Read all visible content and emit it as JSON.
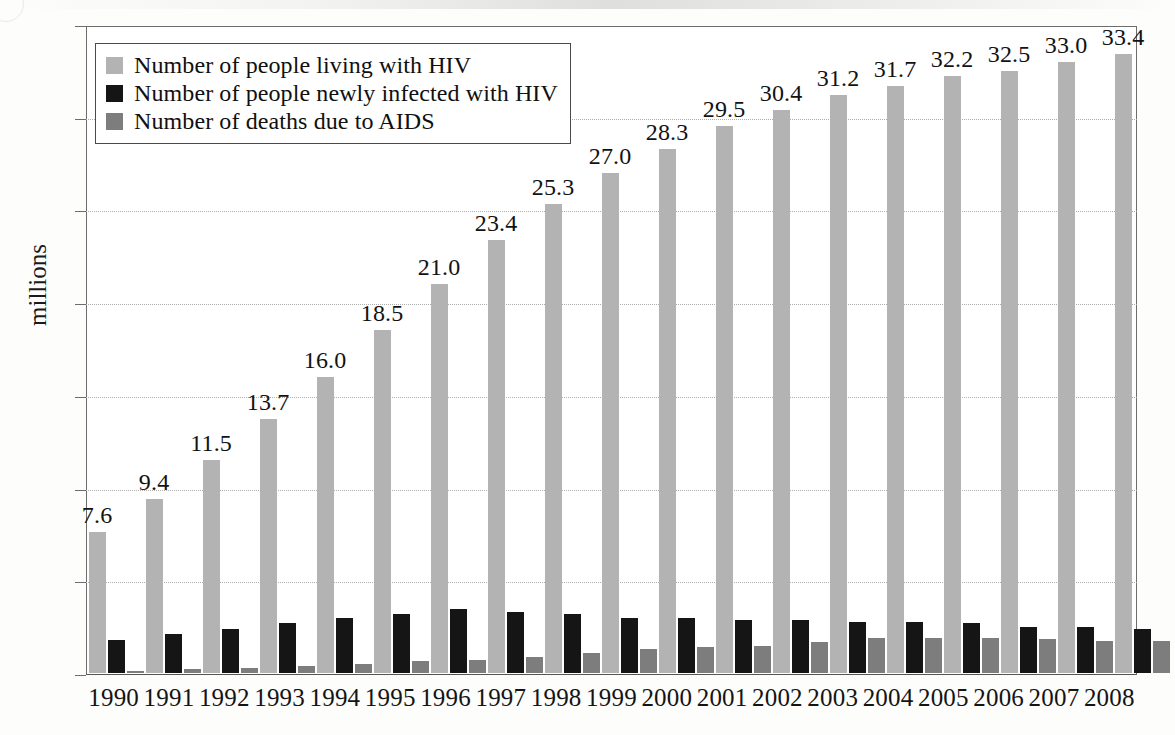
{
  "chart_data": {
    "type": "bar",
    "title": "",
    "subtitle": "",
    "xlabel": "",
    "ylabel": "millions",
    "ylim": [
      0,
      35
    ],
    "ytick_step": 5,
    "yticks": [
      "0",
      "5",
      "10",
      "15",
      "20",
      "25",
      "30",
      "35"
    ],
    "grid": "horizontal-dotted",
    "legend_position": "top-left-inside",
    "categories": [
      "1990",
      "1991",
      "1992",
      "1993",
      "1994",
      "1995",
      "1996",
      "1997",
      "1998",
      "1999",
      "2000",
      "2001",
      "2002",
      "2003",
      "2004",
      "2005",
      "2006",
      "2007",
      "2008"
    ],
    "series": [
      {
        "name": "Number of people living with HIV",
        "color": "#b3b3b3",
        "labelled": true,
        "values": [
          7.6,
          9.4,
          11.5,
          13.7,
          16.0,
          18.5,
          21.0,
          23.4,
          25.3,
          27.0,
          28.3,
          29.5,
          30.4,
          31.2,
          31.7,
          32.2,
          32.5,
          33.0,
          33.4
        ],
        "value_labels": [
          "7.6",
          "9.4",
          "11.5",
          "13.7",
          "16.0",
          "18.5",
          "21.0",
          "23.4",
          "25.3",
          "27.0",
          "28.3",
          "29.5",
          "30.4",
          "31.2",
          "31.7",
          "32.2",
          "32.5",
          "33.0",
          "33.4"
        ]
      },
      {
        "name": "Number of people newly infected with HIV",
        "color": "#151515",
        "labelled": false,
        "values": [
          1.8,
          2.1,
          2.4,
          2.7,
          3.0,
          3.2,
          3.5,
          3.3,
          3.2,
          3.0,
          3.0,
          2.9,
          2.9,
          2.8,
          2.8,
          2.7,
          2.5,
          2.5,
          2.4
        ],
        "value_labels": []
      },
      {
        "name": "Number of deaths due to AIDS",
        "color": "#7d7d7d",
        "labelled": false,
        "values": [
          0.15,
          0.25,
          0.3,
          0.4,
          0.5,
          0.65,
          0.75,
          0.9,
          1.1,
          1.3,
          1.4,
          1.5,
          1.7,
          1.9,
          1.9,
          1.9,
          1.85,
          1.75,
          1.75
        ],
        "value_labels": []
      }
    ]
  },
  "legend": {
    "items": [
      {
        "label": "Number of people living with HIV",
        "swatch": "light-gray-swatch"
      },
      {
        "label": "Number of people newly infected with HIV",
        "swatch": "black-swatch"
      },
      {
        "label": "Number of deaths due to AIDS",
        "swatch": "dark-gray-swatch"
      }
    ]
  },
  "colors": {
    "series_living": "#b3b3b3",
    "series_new_infections": "#151515",
    "series_deaths": "#7d7d7d",
    "axis": "#6d6d6d",
    "gridline": "#aeaeae",
    "text": "#141414"
  }
}
